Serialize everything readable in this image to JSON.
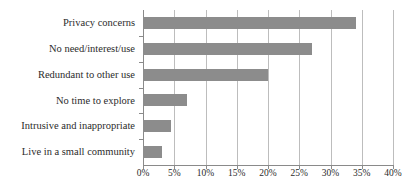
{
  "chart_data": {
    "type": "bar",
    "orientation": "horizontal",
    "title": "",
    "xlabel": "",
    "ylabel": "",
    "categories": [
      "Privacy concerns",
      "No need/interest/use",
      "Redundant to other use",
      "No time to explore",
      "Intrusive and inappropriate",
      "Live in a small community"
    ],
    "values": [
      34,
      27,
      20,
      7,
      4.5,
      3
    ],
    "xlim": [
      0,
      40
    ],
    "xticks": [
      0,
      5,
      10,
      15,
      20,
      25,
      30,
      35,
      40
    ],
    "xticklabels": [
      "0%",
      "5%",
      "10%",
      "15%",
      "20%",
      "25%",
      "30%",
      "35%",
      "40%"
    ],
    "grid": "vertical",
    "legend": null,
    "bar_color": "#8c8c8c",
    "axis_color": "#8a8a8a",
    "gridline_color": "#bdbdbd"
  }
}
